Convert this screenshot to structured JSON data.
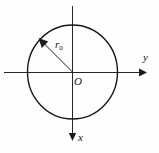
{
  "figure": {
    "kind": "coordinate-diagram",
    "background_color": "#fefefe",
    "stroke_color": "#1d1d1d",
    "labels": {
      "origin": "O",
      "horizontal_axis": "y",
      "vertical_axis": "x",
      "radius_symbol": "r",
      "radius_subscript": "0",
      "radius_full": "r0"
    },
    "geometry": {
      "center_x": 72,
      "center_y": 72,
      "circle_radius_x": 45,
      "circle_radius_y": 47,
      "horizontal_axis_start_x": 4,
      "horizontal_axis_end_x": 142,
      "vertical_axis_start_y": 6,
      "vertical_axis_end_y": 138,
      "radius_arrow_tip_x": 40,
      "radius_arrow_tip_y": 40
    },
    "arrows": {
      "horizontal": "right",
      "vertical": "down",
      "radius": "outward-upper-left"
    }
  }
}
